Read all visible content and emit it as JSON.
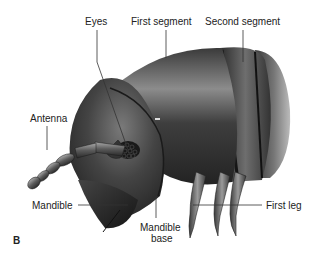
{
  "figure": {
    "panel_letter": "B",
    "labels": {
      "eyes": "Eyes",
      "first_segment": "First segment",
      "second_segment": "Second segment",
      "antenna": "Antenna",
      "mandible": "Mandible",
      "mandible_base_line1": "Mandible",
      "mandible_base_line2": "base",
      "first_leg": "First leg"
    },
    "colors": {
      "body_dark": "#2a2a2a",
      "body_mid": "#4a4a4a",
      "body_light": "#8a8a8a",
      "label_text": "#222222",
      "leader_line": "#333333"
    }
  }
}
